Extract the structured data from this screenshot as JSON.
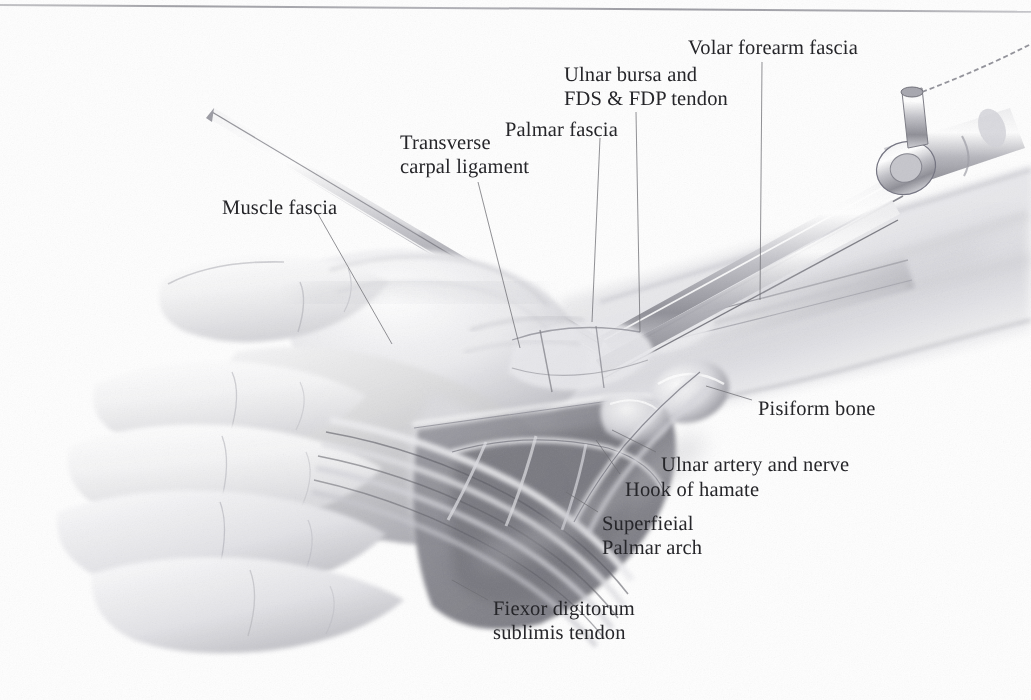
{
  "figure": {
    "style": "grayscale airbrush / pencil medical illustration",
    "background_color": "#fefefe",
    "text_color": "#26262a",
    "leader_color": "#6e6e74"
  },
  "labels": [
    {
      "id": "volar-forearm-fascia",
      "text": "Volar forearm fascia",
      "lines": [
        "Volar forearm fascia"
      ],
      "x": 688,
      "y": 36,
      "align": "left"
    },
    {
      "id": "ulnar-bursa-fds-fdp",
      "text": "Ulnar bursa and\nFDS & FDP tendon",
      "lines": [
        "Ulnar bursa and",
        "FDS & FDP tendon"
      ],
      "x": 564,
      "y": 63,
      "align": "left"
    },
    {
      "id": "palmar-fascia",
      "text": "Palmar fascia",
      "lines": [
        "Palmar fascia"
      ],
      "x": 505,
      "y": 118,
      "align": "left"
    },
    {
      "id": "transverse-carpal-ligament",
      "text": "Transverse\ncarpal ligament",
      "lines": [
        "Transverse",
        "carpal ligament"
      ],
      "x": 400,
      "y": 131,
      "align": "left"
    },
    {
      "id": "muscle-fascia",
      "text": "Muscle fascia",
      "lines": [
        "Muscle fascia"
      ],
      "x": 222,
      "y": 196,
      "align": "left"
    },
    {
      "id": "pisiform-bone",
      "text": "Pisiform bone",
      "lines": [
        "Pisiform bone"
      ],
      "x": 758,
      "y": 397,
      "align": "left"
    },
    {
      "id": "ulnar-artery-and-nerve",
      "text": "Ulnar artery and nerve",
      "lines": [
        "Ulnar artery and nerve"
      ],
      "x": 661,
      "y": 453,
      "align": "left"
    },
    {
      "id": "hook-of-hamate",
      "text": "Hook of hamate",
      "lines": [
        "Hook of hamate"
      ],
      "x": 625,
      "y": 478,
      "align": "left"
    },
    {
      "id": "superficial-palmar-arch",
      "text": "Superfieial\nPalmar arch",
      "lines": [
        "Superfieial",
        "Palmar arch"
      ],
      "x": 602,
      "y": 512,
      "align": "left"
    },
    {
      "id": "flexor-digitorum-sublimis-tendon",
      "text": "Fiexor digitorum\nsublimis tendon",
      "lines": [
        "Fiexor digitorum",
        "sublimis tendon"
      ],
      "x": 493,
      "y": 597,
      "align": "left"
    }
  ]
}
